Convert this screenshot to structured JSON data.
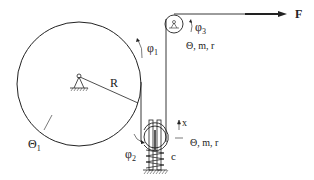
{
  "diagram": {
    "labels": {
      "R": "R",
      "theta1": "Θ",
      "theta1_sub": "1",
      "phi1": "φ",
      "phi1_sub": "1",
      "phi2": "φ",
      "phi2_sub": "2",
      "phi3": "φ",
      "phi3_sub": "3",
      "upper_pulley_params": "Θ, m, r",
      "lower_pulley_params": "Θ, m, r",
      "x": "x",
      "c": "c",
      "F": "F"
    },
    "colors": {
      "line": "#222222",
      "background": "#ffffff"
    }
  }
}
